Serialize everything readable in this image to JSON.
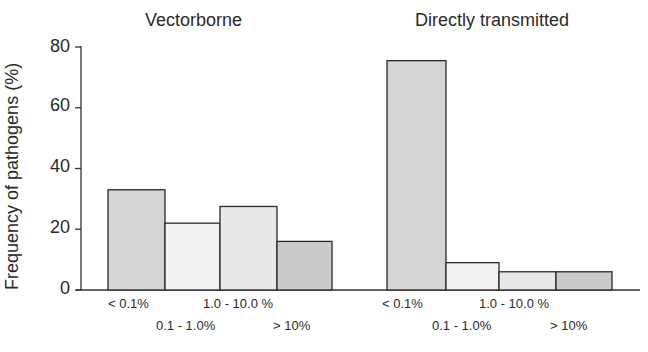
{
  "chart_data": {
    "type": "bar",
    "ylabel": "Frequency of pathogens (%)",
    "xlabel": "",
    "ylim": [
      0,
      80
    ],
    "yticks": [
      0,
      20,
      40,
      60,
      80
    ],
    "grid": false,
    "legend": null,
    "categories": [
      "< 0.1%",
      "0.1 - 1.0%",
      "1.0 - 10.0 %",
      "> 10%"
    ],
    "panels": [
      {
        "title": "Vectorborne",
        "values": [
          33,
          22,
          27.5,
          16
        ]
      },
      {
        "title": "Directly transmitted",
        "values": [
          75.5,
          9,
          6,
          6
        ]
      }
    ],
    "bar_colors": [
      "#d4d4d4",
      "#f2f2f2",
      "#e8e8e8",
      "#cbcbcb"
    ]
  },
  "titles": {
    "left": "Vectorborne",
    "right": "Directly transmitted"
  },
  "axis": {
    "ylabel": "Frequency of pathogens (%)",
    "ticks": [
      "0",
      "20",
      "40",
      "60",
      "80"
    ]
  },
  "categories": {
    "c0": "< 0.1%",
    "c1": "0.1 - 1.0%",
    "c2": "1.0 - 10.0 %",
    "c3": "> 10%"
  }
}
